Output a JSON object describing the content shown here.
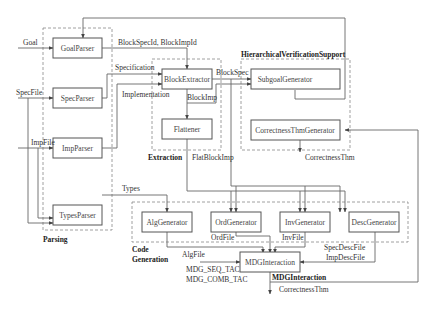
{
  "diagram": {
    "groups": {
      "parsing": "Parsing",
      "extraction": "Extraction",
      "hierarchical": "HierarchicalVerificationSupport",
      "codegen_line1": "Code",
      "codegen_line2": "Generation",
      "mdg": "MDGInteraction"
    },
    "boxes": {
      "goal_parser": "GoalParser",
      "spec_parser": "SpecParser",
      "imp_parser": "ImpParser",
      "types_parser": "TypesParser",
      "block_extractor": "BlockExtractor",
      "flattener": "Flattener",
      "subgoal_generator": "SubgoalGenerator",
      "correctness_thm_generator": "CorrectnessThmGenerator",
      "alg_generator": "AlgGenerator",
      "ord_generator": "OrdGenerator",
      "inv_generator": "InvGenerator",
      "desc_generator": "DescGenerator",
      "mdg_interaction": "MDGInteraction"
    },
    "edges": {
      "goal": "Goal",
      "spec_file": "SpecFile",
      "imp_file": "ImpFile",
      "block_spec_id": "BlockSpecId, BlockImpId",
      "specification": "Specification",
      "implementation": "Implementation",
      "block_imp": "BlockImp",
      "block_spec": "BlockSpec",
      "flat_block_imp": "FlatBlockImp",
      "correctness_thm_top": "CorrectnessThm",
      "types": "Types",
      "ord_file": "OrdFile",
      "inv_file": "InvFile",
      "alg_file": "AlgFile",
      "spec_desc_file": "SpecDescFile",
      "imp_desc_file": "ImpDescFile",
      "mdg_seq_tac": "MDG_SEQ_TAC",
      "mdg_comb_tac": "MDG_COMB_TAC",
      "correctness_thm_bottom": "CorrectnessThm"
    }
  }
}
